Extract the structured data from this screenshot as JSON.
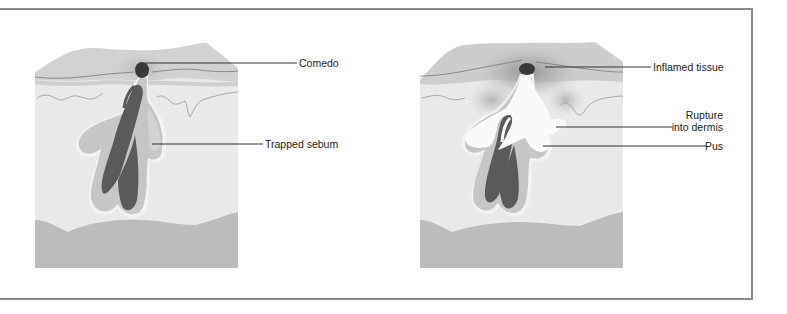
{
  "figure": {
    "title": "",
    "panels": [
      {
        "id": "comedo-panel",
        "labels": [
          {
            "text": "Comedo"
          },
          {
            "text": "Trapped sebum"
          }
        ]
      },
      {
        "id": "inflamed-panel",
        "labels": [
          {
            "text": "Inflamed tissue"
          },
          {
            "text": "Rupture"
          },
          {
            "text": "into dermis"
          },
          {
            "text": "Pus"
          }
        ]
      }
    ],
    "colors": {
      "border": "#8a8a8a",
      "epidermis": "#d2d2d2",
      "dermis": "#e9e9e9",
      "subcutis": "#bcbcbc",
      "follicle_wall": "#c6c6c6",
      "hair": "#5a5a5a",
      "comedo": "#3a3a3a",
      "pus": "#fafafa"
    }
  }
}
